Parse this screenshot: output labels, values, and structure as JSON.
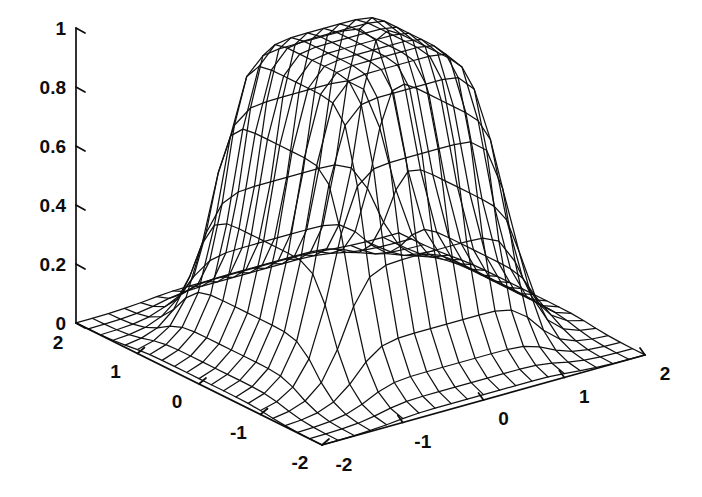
{
  "figure": {
    "kind": "matlab-mesh-surface",
    "background_color": "#ffffff",
    "line_color": "#111111",
    "width": 702,
    "height": 497
  },
  "chart_data": {
    "type": "surface",
    "title": "",
    "xlabel": "",
    "ylabel": "",
    "zlabel": "",
    "grid": false,
    "legend": "none",
    "projection": "3d-wireframe-mesh",
    "view": {
      "azimuth": -37.5,
      "elevation": 30
    },
    "xlim": [
      -2,
      2
    ],
    "ylim": [
      -2,
      2
    ],
    "zlim": [
      0,
      1
    ],
    "x_ticks": [
      -2,
      -1,
      0,
      1,
      2
    ],
    "x_tick_labels": [
      "-2",
      "-1",
      "0",
      "1",
      "2"
    ],
    "y_ticks": [
      -2,
      -1,
      0,
      1,
      2
    ],
    "y_tick_labels": [
      "2",
      "1",
      "0",
      "-1",
      "-2"
    ],
    "z_ticks": [
      0,
      0.2,
      0.4,
      0.6,
      0.8,
      1
    ],
    "z_tick_labels": [
      "0",
      "0.2",
      "0.4",
      "0.6",
      "0.8",
      "1"
    ],
    "mesh": {
      "nx": 21,
      "ny": 21,
      "x_start": -2,
      "x_end": 2,
      "y_start": -2,
      "y_end": 2
    },
    "surface_model": {
      "description": "Plateau / saturating membership surface: product of two steep logistic shoulders in x and y, flat top at 1, decaying to 0 at the domain corners",
      "formula": "z = 1 / ((1 + (|x|/a)^(2b)) * (1 + (|y|/a)^(2b)))",
      "a": 1.15,
      "b": 3.6,
      "z_plateau": 1.0,
      "z_corner": 0.0
    }
  },
  "axes": {
    "z_axis": {
      "name": "z-axis",
      "ticks": [
        {
          "value": 1,
          "label": "1"
        },
        {
          "value": 0.8,
          "label": "0.8"
        },
        {
          "value": 0.6,
          "label": "0.6"
        },
        {
          "value": 0.4,
          "label": "0.4"
        },
        {
          "value": 0.2,
          "label": "0.2"
        },
        {
          "value": 0,
          "label": "0"
        }
      ]
    },
    "left_axis": {
      "name": "y-axis-left-front",
      "ticks": [
        {
          "value": 2,
          "label": "2"
        },
        {
          "value": 1,
          "label": "1"
        },
        {
          "value": 0,
          "label": "0"
        },
        {
          "value": -1,
          "label": "-1"
        },
        {
          "value": -2,
          "label": "-2"
        }
      ]
    },
    "right_axis": {
      "name": "x-axis-right-front",
      "ticks": [
        {
          "value": -2,
          "label": "-2"
        },
        {
          "value": -1,
          "label": "-1"
        },
        {
          "value": 0,
          "label": "0"
        },
        {
          "value": 1,
          "label": "1"
        },
        {
          "value": 2,
          "label": "2"
        }
      ]
    }
  }
}
